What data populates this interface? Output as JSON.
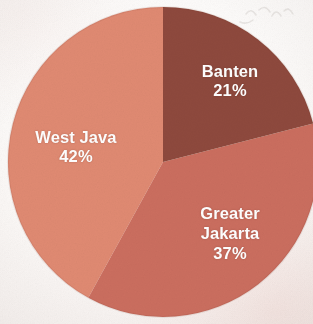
{
  "figure": {
    "kind": "pie-chart",
    "background_color": "#fbf9f7",
    "label_text_color": "#ffffff"
  },
  "chart_data": {
    "type": "pie",
    "title": "",
    "subtitle": "",
    "xlabel": "",
    "ylabel": "",
    "legend_position": "none",
    "grid": false,
    "labels_inside_slices": true,
    "start_angle_deg": 0,
    "direction": "clockwise",
    "categories": [
      "Banten",
      "Greater Jakarta",
      "West Java"
    ],
    "values": [
      21,
      37,
      42
    ],
    "value_unit": "%",
    "colors": [
      "#8e4a3c",
      "#cb6e5e",
      "#e08a72"
    ],
    "slices": [
      {
        "name": "Banten",
        "value": 21,
        "value_label": "21%",
        "color": "#8e4a3c",
        "start_angle_deg": 0,
        "end_angle_deg": 75.6,
        "label_lines": [
          "Banten",
          "21%"
        ]
      },
      {
        "name": "Greater Jakarta",
        "value": 37,
        "value_label": "37%",
        "color": "#cb6e5e",
        "start_angle_deg": 75.6,
        "end_angle_deg": 208.8,
        "label_lines": [
          "Greater",
          "Jakarta",
          "37%"
        ]
      },
      {
        "name": "West Java",
        "value": 42,
        "value_label": "42%",
        "color": "#e08a72",
        "start_angle_deg": 208.8,
        "end_angle_deg": 360,
        "label_lines": [
          "West Java",
          "42%"
        ]
      }
    ]
  },
  "labels": {
    "banten": {
      "name": "Banten",
      "value": "21%"
    },
    "jakarta": {
      "name_line1": "Greater",
      "name_line2": "Jakarta",
      "value": "37%"
    },
    "westjava": {
      "name": "West Java",
      "value": "42%"
    }
  }
}
